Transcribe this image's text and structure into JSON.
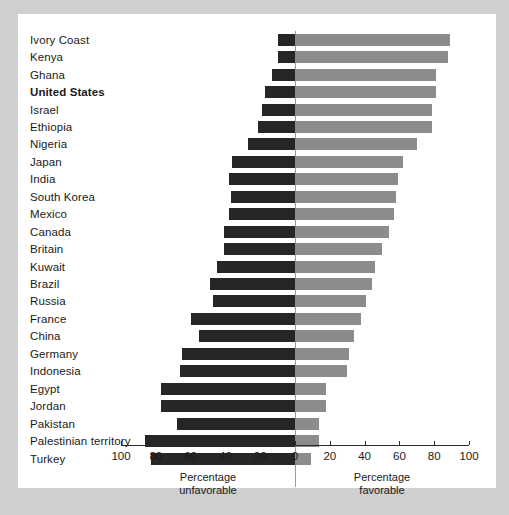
{
  "chart_data": {
    "type": "bar",
    "subtype": "diverging-horizontal",
    "title": "",
    "xlabel_left": "Percentage\nunfavorable",
    "xlabel_right": "Percentage\nfavorable",
    "ylabel": "",
    "xlim": [
      -100,
      100
    ],
    "grid": false,
    "legend": [],
    "tick_labels_left": [
      "100",
      "80",
      "60",
      "40",
      "20"
    ],
    "tick_labels_zero": "0",
    "tick_labels_right": [
      "20",
      "40",
      "60",
      "80",
      "100"
    ],
    "tick_values": [
      -100,
      -80,
      -60,
      -40,
      -20,
      0,
      20,
      40,
      60,
      80,
      100
    ],
    "categories": [
      "Ivory Coast",
      "Kenya",
      "Ghana",
      "United States",
      "Israel",
      "Ethiopia",
      "Nigeria",
      "Japan",
      "India",
      "South Korea",
      "Mexico",
      "Canada",
      "Britain",
      "Kuwait",
      "Brazil",
      "Russia",
      "France",
      "China",
      "Germany",
      "Indonesia",
      "Egypt",
      "Jordan",
      "Pakistan",
      "Palestinian territory",
      "Turkey"
    ],
    "highlighted_category": "United States",
    "series": [
      {
        "name": "Percentage unfavorable",
        "color": "#262626",
        "values": [
          10,
          10,
          13,
          17,
          19,
          21,
          27,
          36,
          38,
          37,
          38,
          41,
          41,
          45,
          49,
          47,
          60,
          55,
          65,
          66,
          77,
          77,
          68,
          86,
          83
        ]
      },
      {
        "name": "Percentage favorable",
        "color": "#8c8c8c",
        "values": [
          89,
          88,
          81,
          81,
          79,
          79,
          70,
          62,
          59,
          58,
          57,
          54,
          50,
          46,
          44,
          41,
          38,
          34,
          31,
          30,
          18,
          18,
          14,
          14,
          9
        ]
      }
    ],
    "rows": [
      {
        "category": "Ivory Coast",
        "unfavorable": 10,
        "favorable": 89,
        "highlight": false
      },
      {
        "category": "Kenya",
        "unfavorable": 10,
        "favorable": 88,
        "highlight": false
      },
      {
        "category": "Ghana",
        "unfavorable": 13,
        "favorable": 81,
        "highlight": false
      },
      {
        "category": "United States",
        "unfavorable": 17,
        "favorable": 81,
        "highlight": true
      },
      {
        "category": "Israel",
        "unfavorable": 19,
        "favorable": 79,
        "highlight": false
      },
      {
        "category": "Ethiopia",
        "unfavorable": 21,
        "favorable": 79,
        "highlight": false
      },
      {
        "category": "Nigeria",
        "unfavorable": 27,
        "favorable": 70,
        "highlight": false
      },
      {
        "category": "Japan",
        "unfavorable": 36,
        "favorable": 62,
        "highlight": false
      },
      {
        "category": "India",
        "unfavorable": 38,
        "favorable": 59,
        "highlight": false
      },
      {
        "category": "South Korea",
        "unfavorable": 37,
        "favorable": 58,
        "highlight": false
      },
      {
        "category": "Mexico",
        "unfavorable": 38,
        "favorable": 57,
        "highlight": false
      },
      {
        "category": "Canada",
        "unfavorable": 41,
        "favorable": 54,
        "highlight": false
      },
      {
        "category": "Britain",
        "unfavorable": 41,
        "favorable": 50,
        "highlight": false
      },
      {
        "category": "Kuwait",
        "unfavorable": 45,
        "favorable": 46,
        "highlight": false
      },
      {
        "category": "Brazil",
        "unfavorable": 49,
        "favorable": 44,
        "highlight": false
      },
      {
        "category": "Russia",
        "unfavorable": 47,
        "favorable": 41,
        "highlight": false
      },
      {
        "category": "France",
        "unfavorable": 60,
        "favorable": 38,
        "highlight": false
      },
      {
        "category": "China",
        "unfavorable": 55,
        "favorable": 34,
        "highlight": false
      },
      {
        "category": "Germany",
        "unfavorable": 65,
        "favorable": 31,
        "highlight": false
      },
      {
        "category": "Indonesia",
        "unfavorable": 66,
        "favorable": 30,
        "highlight": false
      },
      {
        "category": "Egypt",
        "unfavorable": 77,
        "favorable": 18,
        "highlight": false
      },
      {
        "category": "Jordan",
        "unfavorable": 77,
        "favorable": 18,
        "highlight": false
      },
      {
        "category": "Pakistan",
        "unfavorable": 68,
        "favorable": 14,
        "highlight": false
      },
      {
        "category": "Palestinian territory",
        "unfavorable": 86,
        "favorable": 14,
        "highlight": false
      },
      {
        "category": "Turkey",
        "unfavorable": 83,
        "favorable": 9,
        "highlight": false
      }
    ],
    "caption_left_line1": "Percentage",
    "caption_left_line2": "unfavorable",
    "caption_right_line1": "Percentage",
    "caption_right_line2": "favorable",
    "colors": {
      "unfavorable": "#262626",
      "favorable": "#8c8c8c",
      "panel_background": "#ffffff",
      "figure_background": "#cfcfcf",
      "axis": "#2a2a2a",
      "text": "#1a1a1a"
    }
  },
  "layout": {
    "zero_x": 277,
    "px_per_unit": 1.74,
    "row_pitch": 17.45,
    "first_row_top": 17,
    "bar_height": 12,
    "axis_y": 431
  }
}
